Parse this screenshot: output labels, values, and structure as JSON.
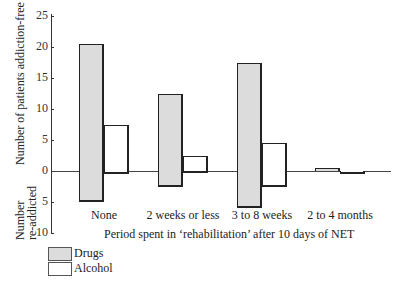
{
  "chart_data": {
    "type": "bar",
    "title": "",
    "xlabel": "Period spent in ‘rehabilitation’ after 10 days of NET",
    "ylabel_top": "Number of patients addiction-free",
    "ylabel_bottom": "Number re-addicted",
    "categories": [
      "None",
      "2 weeks or less",
      "3 to 8 weeks",
      "2 to 4 months"
    ],
    "series": [
      {
        "name": "Drugs",
        "addiction_free": [
          20.5,
          12.5,
          17.5,
          0.5
        ],
        "re_addicted": [
          5,
          2.5,
          6,
          0
        ]
      },
      {
        "name": "Alcohol",
        "addiction_free": [
          7.5,
          2.5,
          4.5,
          0
        ],
        "re_addicted": [
          0.5,
          0.3,
          2.5,
          0.5
        ]
      }
    ],
    "y_ticks_top": [
      "25",
      "20",
      "15",
      "10",
      "5",
      "0"
    ],
    "y_ticks_bottom": [
      "5",
      "10"
    ],
    "ylim": [
      -10,
      25
    ],
    "grid": false,
    "legend_position": "bottom-left",
    "colors": {
      "Drugs": "#dcdcdc",
      "Alcohol": "#ffffff",
      "outline": "#1a1a1a"
    }
  },
  "legend": {
    "drugs": "Drugs",
    "alcohol": "Alcohol"
  },
  "ylabel_bottom_line1": "Number",
  "ylabel_bottom_line2": "re-addicted"
}
